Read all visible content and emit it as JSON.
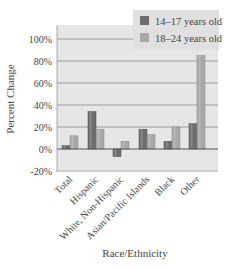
{
  "chart_data": {
    "type": "bar",
    "title": "",
    "xlabel": "Race/Ethnicity",
    "ylabel": "Percent Change",
    "ylim": [
      -20,
      100
    ],
    "yticks": [
      "-20%",
      "0%",
      "20%",
      "40%",
      "60%",
      "80%",
      "100%"
    ],
    "grid": true,
    "legend_position": "top-right",
    "categories": [
      "Total",
      "Hispanic",
      "White, Non-Hispanic",
      "Asian/Pacific Islands",
      "Black",
      "Other"
    ],
    "series": [
      {
        "name": "14–17 years old",
        "color": "#6e6e6e",
        "values": [
          3,
          34,
          -7,
          18,
          7,
          23
        ]
      },
      {
        "name": "18–24 years old",
        "color": "#a8a8a8",
        "values": [
          12,
          18,
          7,
          13,
          20,
          85
        ]
      }
    ]
  },
  "colors": {
    "plot_background": "#e6e6e6",
    "legend_background": "#e0e0e0",
    "gridline": "#8a8a8a"
  }
}
